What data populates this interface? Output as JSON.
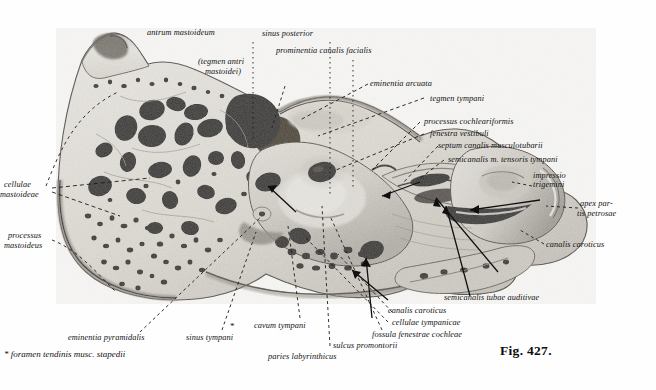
{
  "figure": {
    "caption": "Fig. 427.",
    "footnote": "* foramen tendinis musc. stapedii",
    "asterisk_marker": "*",
    "palette": {
      "background": "#fefefe",
      "ink": "#111111",
      "bone_light": "#e8e6e0",
      "bone_mid": "#b7b3ab",
      "bone_dark": "#6e6a64",
      "cavity": "#1a1a1a",
      "leader": "#1b1b1b"
    }
  },
  "labels": [
    {
      "id": "antrum-mastoideum",
      "text": "antrum mastoideum"
    },
    {
      "id": "tegmen-antri-mastoidei-l1",
      "text": "(tegmen antri"
    },
    {
      "id": "tegmen-antri-mastoidei-l2",
      "text": "mastoidei)"
    },
    {
      "id": "sinus-posterior",
      "text": "sinus posterior"
    },
    {
      "id": "prominentia-canalis-facialis",
      "text": "prominentia canalis facialis"
    },
    {
      "id": "eminentia-arcuata",
      "text": "eminentia arcuata"
    },
    {
      "id": "tegmen-tympani",
      "text": "tegmen tympani"
    },
    {
      "id": "processus-cochleariformis",
      "text": "processus cochleariformis"
    },
    {
      "id": "fenestra-vestibuli",
      "text": "fenestra vestibuli"
    },
    {
      "id": "septum-canalis-musculotubarii",
      "text": "septum canalis musculotubarii"
    },
    {
      "id": "semicanalis-m-tensoris-tympani",
      "text": "semicanalis m. tensoris tympani"
    },
    {
      "id": "impressio-l1",
      "text": "impressio"
    },
    {
      "id": "impressio-l2",
      "text": "trigemini"
    },
    {
      "id": "apex-partis-petrosae-l1",
      "text": "apex par-"
    },
    {
      "id": "apex-partis-petrosae-l2",
      "text": "tis petrosae"
    },
    {
      "id": "canalis-caroticus-right",
      "text": "canalis caroticus"
    },
    {
      "id": "cellulae-mastoideae-l1",
      "text": "cellulae"
    },
    {
      "id": "cellulae-mastoideae-l2",
      "text": "mastoideae"
    },
    {
      "id": "processus-mastoideus-l1",
      "text": "processus"
    },
    {
      "id": "processus-mastoideus-l2",
      "text": "mastoideus"
    },
    {
      "id": "eminentia-pyramidalis",
      "text": "eminentia pyramidalis"
    },
    {
      "id": "sinus-tympani",
      "text": "sinus tympani"
    },
    {
      "id": "cavum-tympani",
      "text": "cavum tympani"
    },
    {
      "id": "paries-labyrinthicus",
      "text": "paries labyrinthicus"
    },
    {
      "id": "sulcus-promontorii",
      "text": "sulcus promontorii"
    },
    {
      "id": "fossula-fenestrae-cochleae",
      "text": "fossula fenestrae cochleae"
    },
    {
      "id": "cellulae-tympanicae",
      "text": "cellulae tympanicae"
    },
    {
      "id": "canalis-caroticus-bottom",
      "text": "canalis caroticus"
    },
    {
      "id": "semicanalis-tubae-auditivae",
      "text": "semicanalis tubae auditivae"
    }
  ]
}
